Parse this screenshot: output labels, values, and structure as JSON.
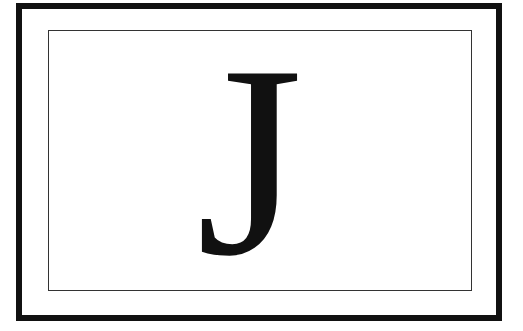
{
  "card": {
    "letter": "J",
    "outer_border_color": "#111111",
    "inner_border_color": "#333333",
    "background": "#ffffff"
  }
}
